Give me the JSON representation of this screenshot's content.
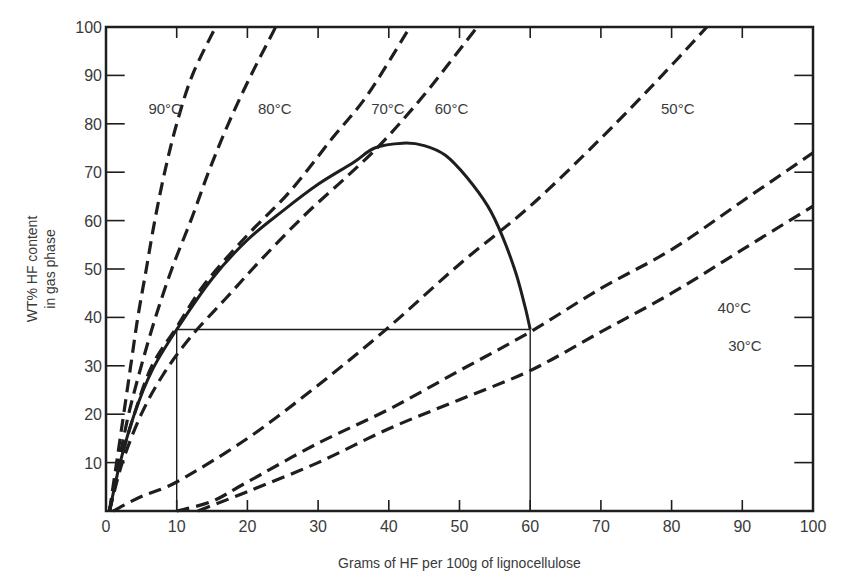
{
  "chart_data": {
    "type": "line",
    "title": "",
    "xlabel": "Grams of HF per 100g of lignocellulose",
    "ylabel_lines": [
      "WT% HF content",
      "in gas phase"
    ],
    "xlim": [
      0,
      100
    ],
    "ylim": [
      0,
      100
    ],
    "grid": false,
    "legend": "inline labels",
    "x_ticks": [
      0,
      10,
      20,
      30,
      40,
      50,
      60,
      70,
      80,
      90,
      100
    ],
    "y_ticks": [
      10,
      20,
      30,
      40,
      50,
      60,
      70,
      80,
      90,
      100
    ],
    "x_tick_labels": [
      "0",
      "10",
      "20",
      "30",
      "40",
      "50",
      "60",
      "70",
      "80",
      "90",
      "100"
    ],
    "y_tick_labels": [
      "10",
      "20",
      "30",
      "40",
      "50",
      "60",
      "70",
      "80",
      "90",
      "100"
    ],
    "series": [
      {
        "name": "90°C",
        "style": "dashed",
        "label_pos": [
          6,
          83
        ],
        "points": [
          [
            0.5,
            0
          ],
          [
            1.5,
            10
          ],
          [
            2.5,
            20
          ],
          [
            3.5,
            30
          ],
          [
            4.5,
            40
          ],
          [
            5.7,
            50
          ],
          [
            6.9,
            60
          ],
          [
            8.3,
            70
          ],
          [
            10,
            80
          ],
          [
            12.2,
            90
          ],
          [
            15.5,
            100
          ]
        ]
      },
      {
        "name": "80°C",
        "style": "dashed",
        "label_pos": [
          21.5,
          83
        ],
        "points": [
          [
            0.5,
            0
          ],
          [
            1.8,
            10
          ],
          [
            3.2,
            20
          ],
          [
            5,
            30
          ],
          [
            7,
            40
          ],
          [
            9.3,
            50
          ],
          [
            12,
            60
          ],
          [
            14.5,
            70
          ],
          [
            17.3,
            80
          ],
          [
            20.5,
            90
          ],
          [
            24,
            100
          ]
        ]
      },
      {
        "name": "70°C",
        "style": "dashed",
        "label_pos": [
          37.5,
          83
        ],
        "points": [
          [
            0.5,
            0
          ],
          [
            2,
            10
          ],
          [
            4,
            20
          ],
          [
            6.5,
            30
          ],
          [
            10,
            38
          ],
          [
            14,
            47
          ],
          [
            20,
            57
          ],
          [
            26,
            66
          ],
          [
            32,
            77
          ],
          [
            37,
            86
          ],
          [
            43,
            100
          ]
        ]
      },
      {
        "name": "60°C",
        "style": "dashed",
        "label_pos": [
          46.5,
          83
        ],
        "points": [
          [
            0.5,
            0
          ],
          [
            2.3,
            10
          ],
          [
            5,
            20
          ],
          [
            8,
            28
          ],
          [
            12,
            36
          ],
          [
            17,
            44
          ],
          [
            22,
            52
          ],
          [
            28,
            61
          ],
          [
            34,
            69
          ],
          [
            39,
            76
          ],
          [
            45,
            86
          ],
          [
            52.5,
            100
          ]
        ]
      },
      {
        "name": "50°C",
        "style": "dashed",
        "label_pos": [
          78.5,
          83
        ],
        "points": [
          [
            1,
            0
          ],
          [
            5,
            3
          ],
          [
            10,
            6
          ],
          [
            20,
            15
          ],
          [
            30,
            26
          ],
          [
            40,
            38
          ],
          [
            50,
            51
          ],
          [
            60,
            63
          ],
          [
            70,
            77
          ],
          [
            78,
            89
          ],
          [
            85,
            100
          ]
        ]
      },
      {
        "name": "40°C",
        "style": "dashed",
        "label_pos": [
          86.5,
          42
        ],
        "points": [
          [
            10,
            0
          ],
          [
            15,
            2
          ],
          [
            20,
            6
          ],
          [
            30,
            14
          ],
          [
            40,
            21
          ],
          [
            50,
            29
          ],
          [
            60,
            37
          ],
          [
            70,
            46
          ],
          [
            80,
            54
          ],
          [
            90,
            64
          ],
          [
            100,
            74
          ]
        ]
      },
      {
        "name": "30°C",
        "style": "dashed",
        "label_pos": [
          88,
          34
        ],
        "points": [
          [
            13,
            0
          ],
          [
            20,
            4
          ],
          [
            30,
            10
          ],
          [
            40,
            17
          ],
          [
            50,
            23
          ],
          [
            60,
            29
          ],
          [
            70,
            37
          ],
          [
            80,
            45
          ],
          [
            90,
            54
          ],
          [
            100,
            63
          ]
        ]
      },
      {
        "name": "envelope",
        "style": "solid",
        "points": [
          [
            0.5,
            0
          ],
          [
            2,
            10
          ],
          [
            4,
            20
          ],
          [
            6.5,
            29
          ],
          [
            10,
            37.5
          ],
          [
            15,
            48
          ],
          [
            20,
            56
          ],
          [
            25,
            62
          ],
          [
            30,
            67.5
          ],
          [
            35,
            72
          ],
          [
            38,
            75
          ],
          [
            42,
            76
          ],
          [
            45,
            75.5
          ],
          [
            48,
            73.5
          ],
          [
            51,
            69
          ],
          [
            54,
            63
          ],
          [
            56,
            57
          ],
          [
            58,
            49
          ],
          [
            59.3,
            42
          ],
          [
            60,
            37.5
          ]
        ]
      }
    ],
    "reference_lines": [
      {
        "type": "horizontal",
        "y": 37.5,
        "x_from": 10,
        "x_to": 60
      },
      {
        "type": "vertical",
        "x": 10,
        "y_from": 0,
        "y_to": 37.5
      },
      {
        "type": "vertical",
        "x": 60,
        "y_from": 0,
        "y_to": 37.5
      }
    ],
    "colors": {
      "ink": "#1e1e1e",
      "text": "#3a3a3a",
      "background": "#ffffff"
    }
  }
}
